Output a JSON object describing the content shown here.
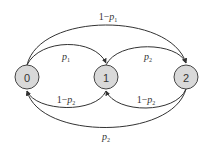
{
  "diagram": {
    "type": "state-transition",
    "nodes": [
      {
        "id": "0",
        "label": "0"
      },
      {
        "id": "1",
        "label": "1"
      },
      {
        "id": "2",
        "label": "2"
      }
    ],
    "edges": [
      {
        "from": "0",
        "to": "2",
        "label": "1−p1",
        "prefix": "1−",
        "var": "p",
        "sub": "1"
      },
      {
        "from": "0",
        "to": "1",
        "label": "p1",
        "prefix": "",
        "var": "p",
        "sub": "1"
      },
      {
        "from": "1",
        "to": "2",
        "label": "p2",
        "prefix": "",
        "var": "p",
        "sub": "2"
      },
      {
        "from": "1",
        "to": "0",
        "label": "1−p2",
        "prefix": "1−",
        "var": "p",
        "sub": "2"
      },
      {
        "from": "2",
        "to": "1",
        "label": "1−p2",
        "prefix": "1−",
        "var": "p",
        "sub": "2"
      },
      {
        "from": "2",
        "to": "0",
        "label": "p2",
        "prefix": "",
        "var": "p",
        "sub": "2"
      }
    ],
    "colors": {
      "node_fill": "#d9d9d9",
      "stroke": "#333333"
    }
  }
}
